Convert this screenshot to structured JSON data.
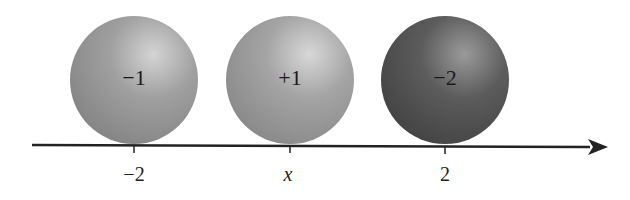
{
  "diagram": {
    "charges": [
      {
        "label": "−1",
        "position_label": "−2",
        "color": "#8f8f8f"
      },
      {
        "label": "+1",
        "position_label": "x",
        "color": "#959595"
      },
      {
        "label": "−2",
        "position_label": "2",
        "color": "#4f4f4f"
      }
    ],
    "axis": {
      "type": "number-line",
      "direction": "right-arrow"
    }
  }
}
